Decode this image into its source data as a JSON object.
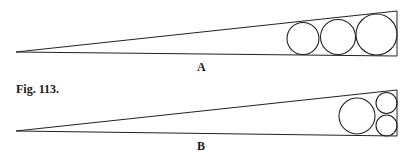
{
  "figure": {
    "caption": "Fig. 113.",
    "stroke_color": "#222222",
    "panels": [
      {
        "label": "A",
        "label_pos": [
          197,
          60
        ],
        "wedge": {
          "apex": [
            16,
            52
          ],
          "right_top": [
            397,
            11
          ],
          "right_bottom": [
            397,
            56
          ]
        },
        "circles": [
          {
            "cx": 303,
            "cy": 38.5,
            "r": 16
          },
          {
            "cx": 338,
            "cy": 37,
            "r": 17.5
          },
          {
            "cx": 376.5,
            "cy": 34.5,
            "r": 20.5
          }
        ]
      },
      {
        "label": "B",
        "label_pos": [
          197,
          139
        ],
        "wedge": {
          "apex": [
            16,
            131
          ],
          "right_top": [
            397,
            90
          ],
          "right_bottom": [
            397,
            136
          ]
        },
        "circles": [
          {
            "cx": 357,
            "cy": 116,
            "r": 18
          },
          {
            "cx": 386.5,
            "cy": 103,
            "r": 10.5
          },
          {
            "cx": 386.5,
            "cy": 125.5,
            "r": 10.5
          }
        ]
      }
    ]
  }
}
